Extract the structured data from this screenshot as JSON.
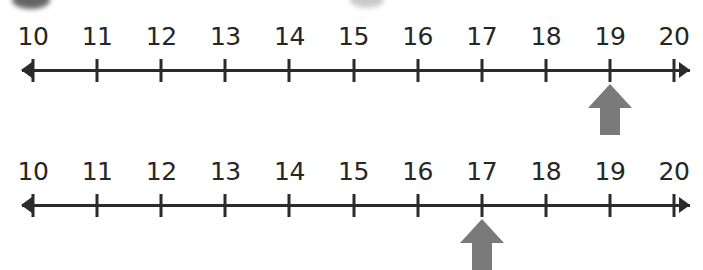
{
  "page": {
    "background_color": "#ffffff"
  },
  "style": {
    "axis_color": "#2b2b2b",
    "label_color": "#262626",
    "pointer_color": "#7a7a7a"
  },
  "artifacts": [
    {
      "name": "top-edge-smudge-dark",
      "tone": "dark"
    },
    {
      "name": "top-edge-smudge-light",
      "tone": "light"
    }
  ],
  "chart_data": {
    "type": "line",
    "xlabel": "",
    "ylabel": "",
    "xlim": [
      10,
      20
    ],
    "grid": false,
    "legend": null,
    "tick_step": 1,
    "categories": [
      "10",
      "11",
      "12",
      "13",
      "14",
      "15",
      "16",
      "17",
      "18",
      "19",
      "20"
    ],
    "values": [
      10,
      11,
      12,
      13,
      14,
      15,
      16,
      17,
      18,
      19,
      20
    ],
    "series": [
      {
        "name": "number-line-1",
        "ticks": [
          "10",
          "11",
          "12",
          "13",
          "14",
          "15",
          "16",
          "17",
          "18",
          "19",
          "20"
        ],
        "tick_values": [
          10,
          11,
          12,
          13,
          14,
          15,
          16,
          17,
          18,
          19,
          20
        ],
        "marked_value": 19,
        "marked_label": "19",
        "left_arrow": true,
        "right_arrow": true
      },
      {
        "name": "number-line-2",
        "ticks": [
          "10",
          "11",
          "12",
          "13",
          "14",
          "15",
          "16",
          "17",
          "18",
          "19",
          "20"
        ],
        "tick_values": [
          10,
          11,
          12,
          13,
          14,
          15,
          16,
          17,
          18,
          19,
          20
        ],
        "marked_value": 17,
        "marked_label": "17",
        "left_arrow": true,
        "right_arrow": true
      }
    ]
  },
  "lines": [
    {
      "id": "number-line-1",
      "labels": [
        "10",
        "11",
        "12",
        "13",
        "14",
        "15",
        "16",
        "17",
        "18",
        "19",
        "20"
      ],
      "pointer_at": "19"
    },
    {
      "id": "number-line-2",
      "labels": [
        "10",
        "11",
        "12",
        "13",
        "14",
        "15",
        "16",
        "17",
        "18",
        "19",
        "20"
      ],
      "pointer_at": "17"
    }
  ]
}
